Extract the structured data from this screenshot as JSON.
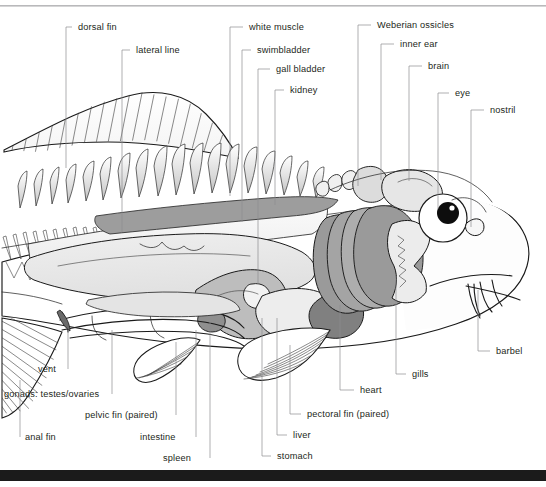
{
  "document": {
    "title": "Fish internal anatomy — labelled cutaway diagram",
    "subject": "carp / cyprinid fish",
    "view": "lateral left-side cutaway, head at right"
  },
  "chrome": {
    "top_rule_color": "#b9b9bb",
    "bottom_bar_color": "#1b1b1b"
  },
  "colors": {
    "ink": "#1a1a1a",
    "label_text": "#231f20",
    "leader_line": "#8d8d91",
    "page": "#ffffff",
    "organ_light": "#e9e9e9",
    "organ_mid": "#c9c9c9",
    "organ_dark": "#9a9a9a",
    "organ_darkest": "#7d7d7d",
    "eye_pupil": "#0d0d0d"
  },
  "labels": [
    {
      "id": "dorsal-fin",
      "text": "dorsal fin",
      "x": 78,
      "y": 30,
      "anchor": "start",
      "side": "top-left",
      "elbow": {
        "hx": 72,
        "hy": 27,
        "vx": 66,
        "vy": 168
      }
    },
    {
      "id": "lateral-line",
      "text": "lateral line",
      "x": 136,
      "y": 53,
      "anchor": "start",
      "side": "top-left",
      "elbow": {
        "hx": 130,
        "hy": 50,
        "vx": 122,
        "vy": 232
      }
    },
    {
      "id": "white-muscle",
      "text": "white muscle",
      "x": 249,
      "y": 30,
      "anchor": "start",
      "side": "top-mid",
      "elbow": {
        "hx": 243,
        "hy": 27,
        "vx": 230,
        "vy": 196
      }
    },
    {
      "id": "swimbladder",
      "text": "swimbladder",
      "x": 257,
      "y": 53,
      "anchor": "start",
      "side": "top-mid",
      "elbow": {
        "hx": 251,
        "hy": 50,
        "vx": 242,
        "vy": 222
      }
    },
    {
      "id": "gall-bladder",
      "text": "gall bladder",
      "x": 276,
      "y": 72,
      "anchor": "start",
      "side": "top-mid",
      "elbow": {
        "hx": 270,
        "hy": 69,
        "vx": 258,
        "vy": 284
      }
    },
    {
      "id": "kidney",
      "text": "kidney",
      "x": 290,
      "y": 93,
      "anchor": "start",
      "side": "top-mid",
      "elbow": {
        "hx": 284,
        "hy": 90,
        "vx": 275,
        "vy": 205
      }
    },
    {
      "id": "weberian",
      "text": "Weberian ossicles",
      "x": 377,
      "y": 28,
      "anchor": "start",
      "side": "top-right",
      "elbow": {
        "hx": 371,
        "hy": 25,
        "vx": 358,
        "vy": 186
      }
    },
    {
      "id": "inner-ear",
      "text": "inner ear",
      "x": 400,
      "y": 47,
      "anchor": "start",
      "side": "top-right",
      "elbow": {
        "hx": 394,
        "hy": 44,
        "vx": 381,
        "vy": 180
      }
    },
    {
      "id": "brain",
      "text": "brain",
      "x": 428,
      "y": 69,
      "anchor": "start",
      "side": "top-right",
      "elbow": {
        "hx": 422,
        "hy": 66,
        "vx": 409,
        "vy": 181
      }
    },
    {
      "id": "eye",
      "text": "eye",
      "x": 455,
      "y": 96,
      "anchor": "start",
      "side": "top-right",
      "elbow": {
        "hx": 449,
        "hy": 93,
        "vx": 438,
        "vy": 209
      }
    },
    {
      "id": "nostril",
      "text": "nostril",
      "x": 490,
      "y": 113,
      "anchor": "start",
      "side": "top-right",
      "elbow": {
        "hx": 484,
        "hy": 110,
        "vx": 471,
        "vy": 227
      }
    },
    {
      "id": "barbel",
      "text": "barbel",
      "x": 496,
      "y": 354,
      "anchor": "start",
      "side": "right",
      "elbow": {
        "hx": 490,
        "hy": 351,
        "vx": 478,
        "vy": 290
      }
    },
    {
      "id": "gills",
      "text": "gills",
      "x": 412,
      "y": 377,
      "anchor": "start",
      "side": "bottom-right",
      "elbow": {
        "hx": 406,
        "hy": 374,
        "vx": 396,
        "vy": 276
      }
    },
    {
      "id": "heart",
      "text": "heart",
      "x": 360,
      "y": 393,
      "anchor": "start",
      "side": "bottom-right",
      "elbow": {
        "hx": 354,
        "hy": 390,
        "vx": 340,
        "vy": 305
      }
    },
    {
      "id": "pectoral-fin",
      "text": "pectoral fin (paired)",
      "x": 307,
      "y": 417,
      "anchor": "start",
      "side": "bottom-right",
      "elbow": {
        "hx": 301,
        "hy": 414,
        "vx": 290,
        "vy": 345
      }
    },
    {
      "id": "liver",
      "text": "liver",
      "x": 293,
      "y": 438,
      "anchor": "start",
      "side": "bottom-right",
      "elbow": {
        "hx": 287,
        "hy": 435,
        "vx": 277,
        "vy": 318
      }
    },
    {
      "id": "stomach",
      "text": "stomach",
      "x": 277,
      "y": 459,
      "anchor": "start",
      "side": "bottom-right",
      "elbow": {
        "hx": 271,
        "hy": 456,
        "vx": 262,
        "vy": 318
      }
    },
    {
      "id": "vent",
      "text": "vent",
      "x": 38,
      "y": 372,
      "anchor": "start",
      "side": "bottom-left",
      "elbow": {
        "hx": 68,
        "hy": 369,
        "vx": 68,
        "vy": 330
      }
    },
    {
      "id": "gonads",
      "text": "gonads: testes/ovaries",
      "x": 4,
      "y": 397,
      "anchor": "start",
      "side": "bottom-left",
      "elbow": {
        "hx": 112,
        "hy": 394,
        "vx": 112,
        "vy": 330
      }
    },
    {
      "id": "pelvic-fin",
      "text": "pelvic fin (paired)",
      "x": 85,
      "y": 418,
      "anchor": "start",
      "side": "bottom-left",
      "elbow": {
        "hx": 176,
        "hy": 415,
        "vx": 176,
        "vy": 342
      }
    },
    {
      "id": "anal-fin",
      "text": "anal fin",
      "x": 25,
      "y": 440,
      "anchor": "start",
      "side": "bottom-left",
      "elbow": {
        "hx": 20,
        "hy": 437,
        "vx": 20,
        "vy": 380
      }
    },
    {
      "id": "intestine",
      "text": "intestine",
      "x": 140,
      "y": 440,
      "anchor": "start",
      "side": "bottom-left",
      "elbow": {
        "hx": 196,
        "hy": 437,
        "vx": 196,
        "vy": 330
      }
    },
    {
      "id": "spleen",
      "text": "spleen",
      "x": 163,
      "y": 461,
      "anchor": "start",
      "side": "bottom-left",
      "elbow": {
        "hx": 210,
        "hy": 458,
        "vx": 210,
        "vy": 322
      }
    }
  ],
  "structures": [
    {
      "id": "dorsal-fin",
      "kind": "fin",
      "shading": "hatched rays"
    },
    {
      "id": "anal-fin",
      "kind": "fin",
      "shading": "hatched rays"
    },
    {
      "id": "pelvic-fin",
      "kind": "fin",
      "shading": "ray lines"
    },
    {
      "id": "pectoral-fin",
      "kind": "fin",
      "shading": "fan of ray lines"
    },
    {
      "id": "vertebral-spines",
      "kind": "skeletal",
      "shading": "neural/haemal spines"
    },
    {
      "id": "swimbladder",
      "kind": "organ",
      "tone": "light"
    },
    {
      "id": "kidney",
      "kind": "organ",
      "tone": "dark"
    },
    {
      "id": "stomach",
      "kind": "organ",
      "tone": "mid"
    },
    {
      "id": "intestine",
      "kind": "organ",
      "tone": "outline"
    },
    {
      "id": "liver",
      "kind": "organ",
      "tone": "light"
    },
    {
      "id": "heart",
      "kind": "organ",
      "tone": "darkest"
    },
    {
      "id": "gills",
      "kind": "organ",
      "tone": "dark arches"
    },
    {
      "id": "eye",
      "kind": "sense",
      "tone": "white sclera, black pupil"
    },
    {
      "id": "brain",
      "kind": "nervous",
      "tone": "light"
    },
    {
      "id": "barbel",
      "kind": "sense",
      "tone": "outline"
    }
  ]
}
